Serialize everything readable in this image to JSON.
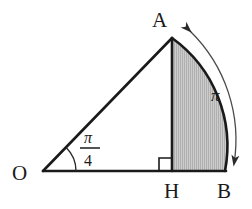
{
  "figure": {
    "background_color": "#ffffff",
    "stroke_color": "#1a1a1a",
    "shade_fill": "#c9c9c9",
    "shade_hatch_color": "#a8a8a8",
    "thin_stroke_color": "#4a4a4a",
    "labels": {
      "origin": "O",
      "apex": "A",
      "foot": "H",
      "base_end": "B"
    },
    "angle_label": {
      "numerator": "π",
      "fraction_bar": "—",
      "denominator": "4",
      "full": "π/4",
      "at_vertex": "O"
    },
    "arc_label": {
      "text": "π",
      "description": "arc length measure from A to B"
    },
    "right_angle_marker": {
      "at_vertex": "H",
      "symbol": "square"
    },
    "points": {
      "O": {
        "x": 43,
        "y": 171
      },
      "A": {
        "x": 172,
        "y": 38
      },
      "H": {
        "x": 172,
        "y": 171
      },
      "B": {
        "x": 225,
        "y": 171
      }
    },
    "shaded_region": "region bounded by segment AH, segment HB and arc BA"
  }
}
